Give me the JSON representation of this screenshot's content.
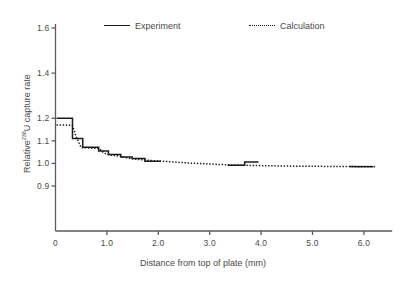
{
  "chart_data": {
    "type": "line",
    "title": "",
    "xlabel": "Distance from top of plate (mm)",
    "ylabel_text": "Relative",
    "ylabel_sup": "238",
    "ylabel_tail": "U capture rate",
    "xlim": [
      0,
      6.55
    ],
    "ylim": [
      0.855,
      1.665
    ],
    "grid": false,
    "legend_position": "top",
    "xticks": [
      {
        "value": 0,
        "label": "0"
      },
      {
        "value": 1.0,
        "label": "1.0"
      },
      {
        "value": 2.0,
        "label": "2.0"
      },
      {
        "value": 3.0,
        "label": "3.0"
      },
      {
        "value": 4.0,
        "label": "4.0"
      },
      {
        "value": 5.0,
        "label": "5.0"
      },
      {
        "value": 6.0,
        "label": "6.0"
      }
    ],
    "yticks": [
      {
        "value": 1.6,
        "label": "1.6"
      },
      {
        "value": 1.4,
        "label": "1.4"
      },
      {
        "value": 1.2,
        "label": "1.2"
      },
      {
        "value": 1.1,
        "label": "1.1"
      },
      {
        "value": 1.0,
        "label": "1.0"
      },
      {
        "value": 0.9,
        "label": "0.9"
      }
    ],
    "series": [
      {
        "name": "Experiment",
        "style": "solid-step",
        "color": "#1a1a1a",
        "segments": [
          [
            [
              0.02,
              1.2
            ],
            [
              0.33,
              1.2
            ],
            [
              0.33,
              1.11
            ],
            [
              0.53,
              1.11
            ],
            [
              0.53,
              1.072
            ],
            [
              0.84,
              1.072
            ],
            [
              0.84,
              1.055
            ],
            [
              1.03,
              1.055
            ],
            [
              1.03,
              1.04
            ],
            [
              1.27,
              1.04
            ],
            [
              1.27,
              1.028
            ],
            [
              1.49,
              1.028
            ],
            [
              1.49,
              1.022
            ],
            [
              1.74,
              1.022
            ],
            [
              1.74,
              1.01
            ],
            [
              2.05,
              1.01
            ]
          ],
          [
            [
              3.35,
              0.992
            ],
            [
              3.68,
              0.992
            ],
            [
              3.68,
              1.006
            ],
            [
              3.95,
              1.006
            ]
          ],
          [
            [
              5.72,
              0.986
            ],
            [
              6.18,
              0.986
            ]
          ]
        ]
      },
      {
        "name": "Calculation",
        "style": "dotted",
        "color": "#1a1a1a",
        "points": [
          [
            0.02,
            1.17
          ],
          [
            0.2,
            1.17
          ],
          [
            0.33,
            1.168
          ],
          [
            0.4,
            1.12
          ],
          [
            0.5,
            1.07
          ],
          [
            0.7,
            1.068
          ],
          [
            0.85,
            1.066
          ],
          [
            0.95,
            1.045
          ],
          [
            1.05,
            1.038
          ],
          [
            1.2,
            1.034
          ],
          [
            1.32,
            1.028
          ],
          [
            1.45,
            1.022
          ],
          [
            1.6,
            1.018
          ],
          [
            1.75,
            1.015
          ],
          [
            1.9,
            1.012
          ],
          [
            2.05,
            1.01
          ],
          [
            2.25,
            1.007
          ],
          [
            2.45,
            1.004
          ],
          [
            2.65,
            1.001
          ],
          [
            2.85,
            0.999
          ],
          [
            3.05,
            0.997
          ],
          [
            3.25,
            0.995
          ],
          [
            3.45,
            0.993
          ],
          [
            3.65,
            0.992
          ],
          [
            3.85,
            0.991
          ],
          [
            4.05,
            0.99
          ],
          [
            4.3,
            0.989
          ],
          [
            4.6,
            0.988
          ],
          [
            4.9,
            0.987
          ],
          [
            5.2,
            0.987
          ],
          [
            5.5,
            0.986
          ],
          [
            5.8,
            0.986
          ],
          [
            6.1,
            0.985
          ],
          [
            6.22,
            0.985
          ]
        ]
      }
    ]
  },
  "legend": {
    "experiment_label": "Experiment",
    "calculation_label": "Calculation"
  },
  "axes": {
    "x_title": "Distance from top of plate (mm)",
    "y_title_prefix": "Relative",
    "y_title_sup": "238",
    "y_title_suffix": "U capture rate"
  },
  "colors": {
    "line": "#1a1a1a",
    "axis": "#5a5a5a",
    "text": "#4a4a4a",
    "background": "#ffffff"
  }
}
